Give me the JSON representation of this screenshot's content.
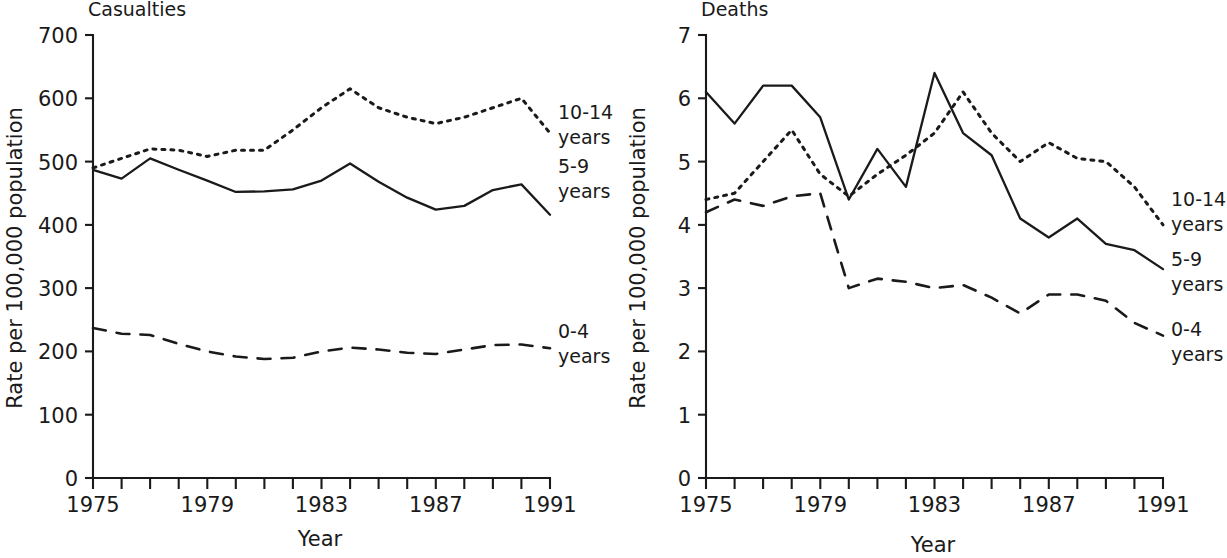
{
  "figure": {
    "panels": [
      {
        "id": "casualties",
        "title": "Casualties",
        "xlabel": "Year",
        "ylabel": "Rate per 100,000 population",
        "ytick_labels": [
          "0",
          "100",
          "200",
          "300",
          "400",
          "500",
          "600",
          "700"
        ],
        "xtick_labels": [
          "1975",
          "1979",
          "1983",
          "1987",
          "1991"
        ],
        "legend": [
          {
            "label_line1": "10-14",
            "label_line2": "years"
          },
          {
            "label_line1": "5-9",
            "label_line2": "years"
          },
          {
            "label_line1": "0-4",
            "label_line2": "years"
          }
        ]
      },
      {
        "id": "deaths",
        "title": "Deaths",
        "xlabel": "Year",
        "ylabel": "Rate per 100,000 population",
        "ytick_labels": [
          "0",
          "1",
          "2",
          "3",
          "4",
          "5",
          "6",
          "7"
        ],
        "xtick_labels": [
          "1975",
          "1979",
          "1983",
          "1987",
          "1991"
        ],
        "legend": [
          {
            "label_line1": "10-14",
            "label_line2": "years"
          },
          {
            "label_line1": "5-9",
            "label_line2": "years"
          },
          {
            "label_line1": "0-4",
            "label_line2": "years"
          }
        ]
      }
    ]
  },
  "chart_data": [
    {
      "type": "line",
      "title": "Casualties",
      "xlabel": "Year",
      "ylabel": "Rate per 100,000 population",
      "x": [
        1975,
        1976,
        1977,
        1978,
        1979,
        1980,
        1981,
        1982,
        1983,
        1984,
        1985,
        1986,
        1987,
        1988,
        1989,
        1990,
        1991
      ],
      "xlim": [
        1975,
        1991
      ],
      "ylim": [
        0,
        700
      ],
      "yticks": [
        0,
        100,
        200,
        300,
        400,
        500,
        600,
        700
      ],
      "xticks": [
        1975,
        1979,
        1983,
        1987,
        1991
      ],
      "grid": false,
      "legend_position": "right-of-axes",
      "series": [
        {
          "name": "10-14 years",
          "style": "dotted",
          "values": [
            490,
            505,
            520,
            518,
            508,
            518,
            518,
            550,
            585,
            615,
            585,
            570,
            560,
            570,
            585,
            600,
            545
          ]
        },
        {
          "name": "5-9 years",
          "style": "solid",
          "values": [
            487,
            473,
            505,
            487,
            470,
            452,
            453,
            456,
            470,
            497,
            468,
            443,
            424,
            430,
            455,
            464,
            416
          ]
        },
        {
          "name": "0-4 years",
          "style": "dashed",
          "values": [
            237,
            228,
            226,
            212,
            200,
            192,
            188,
            190,
            200,
            206,
            203,
            198,
            196,
            203,
            210,
            211,
            205
          ]
        }
      ]
    },
    {
      "type": "line",
      "title": "Deaths",
      "xlabel": "Year",
      "ylabel": "Rate per 100,000 population",
      "x": [
        1975,
        1976,
        1977,
        1978,
        1979,
        1980,
        1981,
        1982,
        1983,
        1984,
        1985,
        1986,
        1987,
        1988,
        1989,
        1990,
        1991
      ],
      "xlim": [
        1975,
        1991
      ],
      "ylim": [
        0,
        7
      ],
      "yticks": [
        0,
        1,
        2,
        3,
        4,
        5,
        6,
        7
      ],
      "xticks": [
        1975,
        1979,
        1983,
        1987,
        1991
      ],
      "grid": false,
      "legend_position": "right-of-axes",
      "series": [
        {
          "name": "10-14 years",
          "style": "dotted",
          "values": [
            4.4,
            4.5,
            5.0,
            5.5,
            4.8,
            4.45,
            4.8,
            5.1,
            5.45,
            6.1,
            5.45,
            5.0,
            5.3,
            5.05,
            5.0,
            4.6,
            4.0
          ]
        },
        {
          "name": "5-9 years",
          "style": "solid",
          "values": [
            6.1,
            5.6,
            6.2,
            6.2,
            5.7,
            4.4,
            5.2,
            4.6,
            6.4,
            5.45,
            5.1,
            4.1,
            3.8,
            4.1,
            3.7,
            3.6,
            3.3
          ]
        },
        {
          "name": "0-4 years",
          "style": "dashed",
          "values": [
            4.2,
            4.4,
            4.3,
            4.45,
            4.5,
            3.0,
            3.15,
            3.1,
            3.0,
            3.05,
            2.85,
            2.6,
            2.9,
            2.9,
            2.8,
            2.45,
            2.25
          ]
        }
      ]
    }
  ]
}
